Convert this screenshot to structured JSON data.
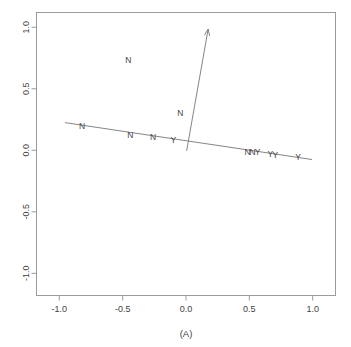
{
  "title": {
    "text": "(clipped)",
    "visible": false
  },
  "axis": {
    "x_label": "(A)",
    "y_label": ""
  },
  "chart_data": {
    "type": "scatter",
    "title": "",
    "subtitle": "",
    "xlabel": "(A)",
    "ylabel": "",
    "xlim": [
      -1.18,
      1.18
    ],
    "ylim": [
      -1.18,
      1.12
    ],
    "grid": false,
    "legend": null,
    "x_ticks": [
      -1.0,
      -0.5,
      0.0,
      0.5,
      1.0
    ],
    "x_tick_labels": [
      "-1.0",
      "-0.5",
      "0.0",
      "0.5",
      "1.0"
    ],
    "y_ticks": [
      -1.0,
      -0.5,
      0.0,
      0.5,
      1.0
    ],
    "y_tick_labels": [
      "-1.0",
      "-0.5",
      "0.0",
      "0.5",
      "1.0"
    ],
    "point_labels": [
      {
        "label": "N",
        "x": -0.82,
        "y": 0.195
      },
      {
        "label": "N",
        "x": -0.44,
        "y": 0.125
      },
      {
        "label": "N",
        "x": -0.26,
        "y": 0.105
      },
      {
        "label": "Y",
        "x": -0.1,
        "y": 0.08
      },
      {
        "label": "N",
        "x": 0.485,
        "y": -0.01
      },
      {
        "label": "N",
        "x": 0.525,
        "y": -0.01
      },
      {
        "label": "Y",
        "x": 0.565,
        "y": -0.015
      },
      {
        "label": "Y",
        "x": 0.665,
        "y": -0.03
      },
      {
        "label": "Y",
        "x": 0.705,
        "y": -0.035
      },
      {
        "label": "Y",
        "x": 0.885,
        "y": -0.055
      },
      {
        "label": "N",
        "x": -0.455,
        "y": 0.735
      },
      {
        "label": "N",
        "x": -0.045,
        "y": 0.3
      }
    ],
    "regression_line": {
      "x_start": -0.955,
      "y_start": 0.225,
      "x_end": 0.995,
      "y_end": -0.075
    },
    "arrow": {
      "x_start": 0.005,
      "y_start": -0.005,
      "x_end": 0.175,
      "y_end": 0.985
    }
  }
}
